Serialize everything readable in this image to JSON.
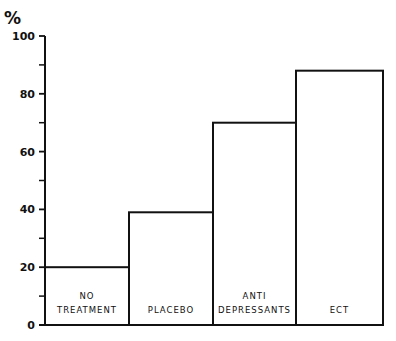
{
  "chart_data": {
    "type": "bar",
    "title": "",
    "ylabel": "%",
    "xlabel": "",
    "ylim": [
      0,
      100
    ],
    "yticks_major": [
      0,
      20,
      40,
      60,
      80,
      100
    ],
    "yticks_minor": [
      10,
      30,
      50,
      70,
      90
    ],
    "categories": [
      [
        "NO",
        "TREATMENT"
      ],
      [
        "PLACEBO"
      ],
      [
        "ANTI",
        "DEPRESSANTS"
      ],
      [
        "ECT"
      ]
    ],
    "values": [
      20,
      39,
      70,
      88
    ],
    "grid": false,
    "legend": "none",
    "colors": {
      "stroke": "#111111",
      "fill": "#ffffff"
    }
  }
}
